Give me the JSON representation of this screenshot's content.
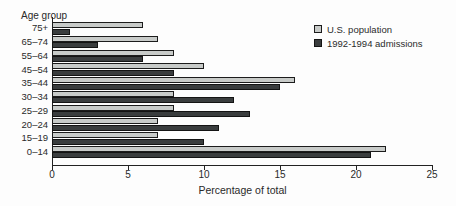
{
  "chart_data": {
    "type": "bar",
    "orientation": "horizontal",
    "axis_label_y": "Age group",
    "xlabel": "Percentage of total",
    "categories": [
      "75+",
      "65–74",
      "55–64",
      "45–54",
      "35–44",
      "30–34",
      "25–29",
      "20–24",
      "15–19",
      "0–14"
    ],
    "series": [
      {
        "name": "U.S. population",
        "color": "#c8cbc9",
        "values": [
          6,
          7,
          8,
          10,
          16,
          8,
          8,
          7,
          7,
          22
        ]
      },
      {
        "name": "1992-1994 admissions",
        "color": "#3a3d3e",
        "values": [
          1.2,
          3,
          6,
          8,
          15,
          12,
          13,
          11,
          10,
          21
        ]
      }
    ],
    "xlim": [
      0,
      25
    ],
    "xticks": [
      0,
      5,
      10,
      15,
      20,
      25
    ],
    "grid": false,
    "legend_position": "top-right",
    "colors": {
      "axis": "#222222",
      "text": "#2a2a2a",
      "background": "#fdfdfd"
    }
  }
}
